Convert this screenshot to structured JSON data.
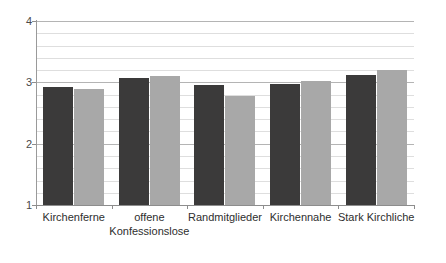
{
  "chart_data": {
    "type": "bar",
    "title": "",
    "subtitle": "",
    "xlabel": "",
    "ylabel": "",
    "ylim": [
      1,
      4
    ],
    "yticks": [
      1,
      2,
      3,
      4
    ],
    "ytick_labels": [
      "1",
      "2",
      "3",
      "4"
    ],
    "grid": true,
    "grid_minor": true,
    "minor_step": 0.2,
    "legend": "none",
    "orientation": "vertical",
    "grouping": "grouped",
    "categories": [
      "Kirchenferne",
      "offene\nKonfessionslose",
      "Randmitglieder",
      "Kirchennahe",
      "Stark Kirchliche"
    ],
    "series": [
      {
        "name": "series-1",
        "color": "#3b3a3a",
        "values": [
          2.93,
          3.07,
          2.95,
          2.97,
          3.12
        ]
      },
      {
        "name": "series-2",
        "color": "#a8a8a8",
        "values": [
          2.9,
          3.11,
          2.78,
          3.02,
          3.2
        ]
      }
    ]
  },
  "colors": {
    "series_dark": "#3b3a3a",
    "series_light": "#a8a8a8",
    "gridline_major": "#b4b4b4",
    "gridline_minor": "#dedede",
    "axis": "#8d8d8d",
    "background": "#ffffff",
    "tick_text": "#4a4a4a",
    "category_text": "#2e2e2e"
  }
}
